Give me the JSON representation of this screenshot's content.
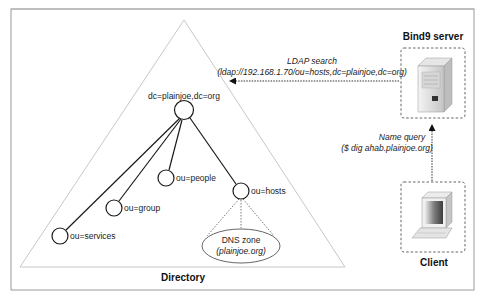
{
  "diagram": {
    "directory": {
      "title": "Directory",
      "root": {
        "label": "dc=plainjoe,dc=org"
      },
      "children": [
        {
          "id": "people",
          "label": "ou=people"
        },
        {
          "id": "group",
          "label": "ou=group"
        },
        {
          "id": "services",
          "label": "ou=services"
        },
        {
          "id": "hosts",
          "label": "ou=hosts"
        }
      ],
      "dns_zone": {
        "line1": "DNS zone",
        "line2": "(plainjoe.org)"
      }
    },
    "server": {
      "title": "Bind9 server",
      "icon": "server-tower-icon"
    },
    "client": {
      "title": "Client",
      "icon": "desktop-computer-icon"
    },
    "ldap_search": {
      "line1": "LDAP search",
      "line2": "(ldap://192.168.1.70/ou=hosts,dc=plainjoe,dc=org)"
    },
    "name_query": {
      "line1": "Name query",
      "line2": "($ dig ahab.plainjoe.org)"
    },
    "colors": {
      "frame": "#9a9a9a",
      "triangle": "#c8c8c8",
      "tree_lines": "#1a1a1a",
      "dashed": "#555555",
      "text": "#222222"
    }
  }
}
